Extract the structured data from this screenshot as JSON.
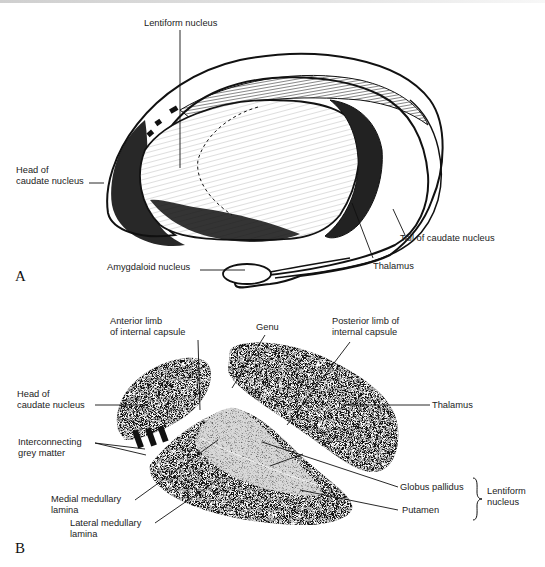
{
  "figure": {
    "panels": [
      {
        "id": "A",
        "letter": "A",
        "labels": {
          "lentiform_nucleus": "Lentiform nucleus",
          "head_caudate_line1": "Head of",
          "head_caudate_line2": "caudate nucleus",
          "tail_caudate": "Tail of caudate nucleus",
          "thalamus": "Thalamus",
          "amygdaloid": "Amygdaloid nucleus"
        }
      },
      {
        "id": "B",
        "letter": "B",
        "labels": {
          "anterior_limb_line1": "Anterior limb",
          "anterior_limb_line2": "of internal capsule",
          "genu": "Genu",
          "posterior_limb_line1": "Posterior limb of",
          "posterior_limb_line2": "internal capsule",
          "head_caudate_line1": "Head of",
          "head_caudate_line2": "caudate nucleus",
          "thalamus": "Thalamus",
          "interconnecting_line1": "Interconnecting",
          "interconnecting_line2": "grey matter",
          "globus_pallidus": "Globus pallidus",
          "putamen": "Putamen",
          "lentiform_line1": "Lentiform",
          "lentiform_line2": "nucleus",
          "medial_lamina_line1": "Medial medullary",
          "medial_lamina_line2": "lamina",
          "lateral_lamina_line1": "Lateral medullary",
          "lateral_lamina_line2": "lamina"
        }
      }
    ],
    "colors": {
      "ink": "#111111",
      "paper": "#ffffff",
      "grey_matter_light": "#d8d8d8"
    }
  }
}
